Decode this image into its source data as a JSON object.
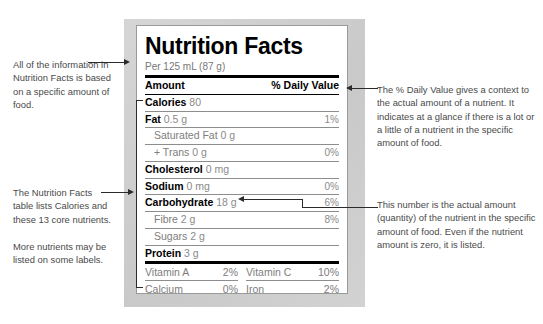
{
  "label": {
    "title": "Nutrition Facts",
    "serving": "Per 125 mL (87 g)",
    "header": {
      "amount": "Amount",
      "daily_value": "% Daily Value"
    },
    "rows": [
      {
        "name": "Calories",
        "amount": "80",
        "dv": "",
        "bold": true,
        "sub": false
      },
      {
        "name": "Fat",
        "amount": "0.5 g",
        "dv": "1%",
        "bold": true,
        "sub": false
      },
      {
        "name": "Saturated Fat",
        "amount": "0 g",
        "dv": "",
        "bold": false,
        "sub": true
      },
      {
        "name": "+ Trans",
        "amount": "0 g",
        "dv": "0%",
        "bold": false,
        "sub": true
      },
      {
        "name": "Cholesterol",
        "amount": "0 mg",
        "dv": "",
        "bold": true,
        "sub": false
      },
      {
        "name": "Sodium",
        "amount": "0 mg",
        "dv": "0%",
        "bold": true,
        "sub": false
      },
      {
        "name": "Carbohydrate",
        "amount": "18 g",
        "dv": "6%",
        "bold": true,
        "sub": false
      },
      {
        "name": "Fibre",
        "amount": "2 g",
        "dv": "8%",
        "bold": false,
        "sub": true
      },
      {
        "name": "Sugars",
        "amount": "2 g",
        "dv": "",
        "bold": false,
        "sub": true
      },
      {
        "name": "Protein",
        "amount": "3 g",
        "dv": "",
        "bold": true,
        "sub": false
      }
    ],
    "vitamins": [
      {
        "name": "Vitamin A",
        "dv": "2%"
      },
      {
        "name": "Vitamin C",
        "dv": "10%"
      },
      {
        "name": "Calcium",
        "dv": "0%"
      },
      {
        "name": "Iron",
        "dv": "2%"
      }
    ]
  },
  "annotations": {
    "serving": "All of the information in Nutrition Facts is based on a specific amount of food.",
    "nutrients": "The Nutrition Facts table lists Calories and these 13 core nutrients.",
    "more": "More nutrients may be listed on some labels.",
    "daily_value": "The % Daily Value gives a context to the actual amount of a nutrient. It indicates at a glance if there is a lot or a little of a nutrient in the specific amount of food.",
    "amount": "This number is the actual amount (quantity) of the nutrient in the specific amount of food. Even if the nutrient amount is zero, it is listed."
  },
  "colors": {
    "text": "#4a4a4a",
    "rule": "#000000",
    "frame": "#cfcfcf",
    "value": "#8a8a8a"
  }
}
